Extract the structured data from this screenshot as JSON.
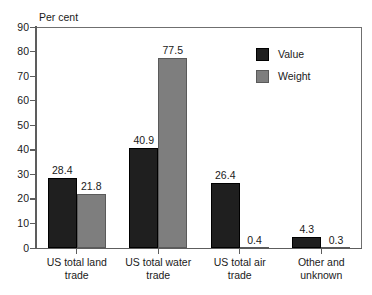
{
  "chart_data": {
    "type": "bar",
    "title": "",
    "subtitle": "",
    "xlabel": "",
    "ylabel": "Per cent",
    "ylim": [
      0,
      90
    ],
    "ytick_step": 10,
    "yticks": [
      "90",
      "80",
      "70",
      "60",
      "50",
      "40",
      "30",
      "20",
      "10",
      "0"
    ],
    "grid": false,
    "legend_position": "top-right-inside",
    "categories": [
      "US total land trade",
      "US total water trade",
      "US total air trade",
      "Other and unknown"
    ],
    "category_lines": [
      [
        "US total land",
        "trade"
      ],
      [
        "US total water",
        "trade"
      ],
      [
        "US total air",
        "trade"
      ],
      [
        "Other and",
        "unknown"
      ]
    ],
    "series": [
      {
        "name": "Value",
        "color": "#1f1f1f",
        "values": [
          28.4,
          40.9,
          26.4,
          4.3
        ],
        "labels": [
          "28.4",
          "40.9",
          "26.4",
          "4.3"
        ]
      },
      {
        "name": "Weight",
        "color": "#7e7e7e",
        "values": [
          21.8,
          77.5,
          0.4,
          0.3
        ],
        "labels": [
          "21.8",
          "77.5",
          "0.4",
          "0.3"
        ]
      }
    ]
  },
  "axis": {
    "y_title": "Per cent"
  },
  "legend": {
    "items": [
      {
        "label": "Value",
        "color": "#1f1f1f"
      },
      {
        "label": "Weight",
        "color": "#7e7e7e"
      }
    ]
  },
  "colors": {
    "value_bar": "#1f1f1f",
    "weight_bar": "#7e7e7e",
    "axis": "#5d5d5d",
    "frame": "#6f6f6f",
    "text": "#1a1a1a",
    "background": "#ffffff"
  }
}
